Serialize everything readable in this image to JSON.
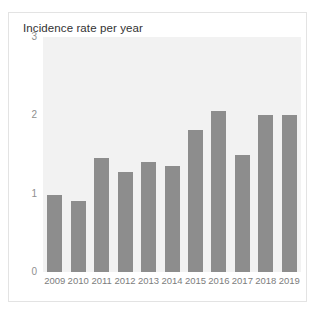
{
  "card": {
    "title": "Incidence rate per year"
  },
  "chart_data": {
    "type": "bar",
    "title": "Incidence rate per year",
    "xlabel": "",
    "ylabel": "",
    "ylim": [
      0,
      3
    ],
    "yticks": [
      0,
      1,
      2,
      3
    ],
    "ytick_labels": [
      "0",
      "1",
      "2",
      "3"
    ],
    "grid": false,
    "legend": null,
    "bar_color": "#8d8d8d",
    "plot_background": "#f2f2f2",
    "categories": [
      "2009",
      "2010",
      "2011",
      "2012",
      "2013",
      "2014",
      "2015",
      "2016",
      "2017",
      "2018",
      "2019"
    ],
    "values": [
      0.98,
      0.91,
      1.45,
      1.28,
      1.4,
      1.35,
      1.81,
      2.05,
      1.5,
      2.0,
      2.0
    ]
  }
}
